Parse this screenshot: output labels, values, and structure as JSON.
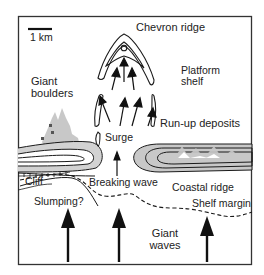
{
  "figure": {
    "type": "schematic map",
    "scale_bar": {
      "label": "1 km"
    },
    "labels": {
      "chevron_ridge": "Chevron ridge",
      "platform_shelf_line1": "Platform",
      "platform_shelf_line2": "shelf",
      "giant_boulders_line1": "Giant",
      "giant_boulders_line2": "boulders",
      "surge": "Surge",
      "run_up_deposits": "Run-up deposits",
      "cliff": "Cliff",
      "breaking_wave": "Breaking wave",
      "coastal_ridge": "Coastal ridge",
      "slumping": "Slumping?",
      "shelf_margin": "Shelf margin",
      "giant_waves_line1": "Giant",
      "giant_waves_line2": "waves"
    },
    "colors": {
      "line": "#1a1a1a",
      "deposit_fill": "#c8c8c8",
      "frame": "#333333",
      "background": "#ffffff"
    }
  }
}
